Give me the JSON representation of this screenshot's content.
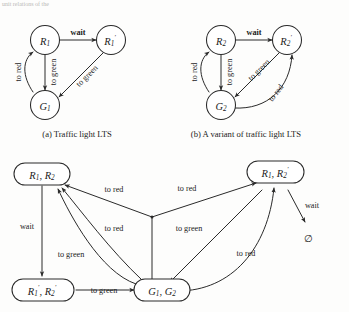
{
  "page": {
    "top_fragment": "unit relations of the",
    "background_color": "#fdfdfc",
    "ink_color": "#2a2a2a"
  },
  "figures": [
    {
      "id": "fig-a",
      "caption": "(a) Traffic light LTS",
      "nodes": [
        {
          "id": "R1",
          "base": "R",
          "sub": "1",
          "prime": false,
          "shape": "circle"
        },
        {
          "id": "R1p",
          "base": "R",
          "sub": "1",
          "prime": true,
          "shape": "circle"
        },
        {
          "id": "G1",
          "base": "G",
          "sub": "1",
          "prime": false,
          "shape": "circle"
        }
      ],
      "edges": [
        {
          "from": "R1",
          "to": "R1p",
          "label": "wait",
          "style": "straight"
        },
        {
          "from": "R1",
          "to": "G1",
          "label": "to green",
          "style": "straight"
        },
        {
          "from": "G1",
          "to": "R1",
          "label": "to red",
          "style": "curved"
        },
        {
          "from": "R1p",
          "to": "G1",
          "label": "to green",
          "style": "straight"
        }
      ]
    },
    {
      "id": "fig-b",
      "caption": "(b) A variant of traffic light LTS",
      "nodes": [
        {
          "id": "R2",
          "base": "R",
          "sub": "2",
          "prime": false,
          "shape": "circle"
        },
        {
          "id": "R2p",
          "base": "R",
          "sub": "2",
          "prime": true,
          "shape": "circle"
        },
        {
          "id": "G2",
          "base": "G",
          "sub": "2",
          "prime": false,
          "shape": "circle"
        }
      ],
      "edges": [
        {
          "from": "R2",
          "to": "R2p",
          "label": "wait",
          "style": "straight"
        },
        {
          "from": "R2",
          "to": "G2",
          "label": "to green",
          "style": "straight"
        },
        {
          "from": "G2",
          "to": "R2",
          "label": "to red",
          "style": "curved"
        },
        {
          "from": "R2p",
          "to": "G2",
          "label": "to green",
          "style": "straight"
        },
        {
          "from": "G2",
          "to": "R2p",
          "label": "to red",
          "style": "curved"
        }
      ]
    },
    {
      "id": "fig-c",
      "caption": "",
      "nodes": [
        {
          "id": "R1R2",
          "label": "R1, R2",
          "shape": "rounded-rect"
        },
        {
          "id": "R1R2p",
          "label": "R1, R2'",
          "shape": "rounded-rect"
        },
        {
          "id": "R1pR2p",
          "label": "R1', R2'",
          "shape": "rounded-rect"
        },
        {
          "id": "G1G2",
          "label": "G1, G2",
          "shape": "rounded-rect"
        },
        {
          "id": "empty",
          "label": "∅",
          "shape": "none"
        }
      ],
      "edges": [
        {
          "from": "R1R2",
          "to": "R1pR2p",
          "label": "wait"
        },
        {
          "from": "R1pR2p",
          "to": "G1G2",
          "label": "to green"
        },
        {
          "from": "G1G2",
          "to": "R1R2",
          "label": "to red"
        },
        {
          "from": "G1G2",
          "to": "R1R2p",
          "label": "to red"
        },
        {
          "from": "G1G2",
          "to": "R1R2",
          "label": "to red"
        },
        {
          "from": "G1G2",
          "to": "R1R2",
          "label": "to green"
        },
        {
          "from": "R1R2p",
          "to": "G1G2",
          "label": "to green"
        },
        {
          "from": "G1G2",
          "to": "R1R2p",
          "label": "to red"
        },
        {
          "from": "R1R2p",
          "to": "empty",
          "label": "wait"
        }
      ]
    }
  ],
  "labels": {
    "wait": "wait",
    "to_red": "to red",
    "to_green": "to green",
    "empty_set": "∅",
    "caption_a": "(a) Traffic light LTS",
    "caption_b": "(b) A variant of traffic light LTS"
  },
  "node_text": {
    "R1": "R",
    "R1_sub": "1",
    "R1p": "R",
    "R1p_sub": "1",
    "G1": "G",
    "G1_sub": "1",
    "R2": "R",
    "R2_sub": "2",
    "R2p": "R",
    "R2p_sub": "2",
    "G2": "G",
    "G2_sub": "2"
  }
}
